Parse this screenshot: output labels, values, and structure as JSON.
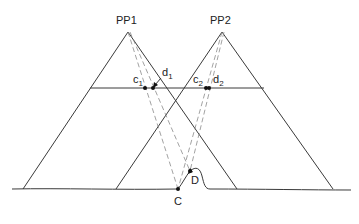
{
  "figure": {
    "type": "stereo-photogrammetry-parallax-diagram",
    "colors": {
      "line": "#3a3a3a",
      "ray": "#8a8a8a",
      "point": "#111111",
      "background": "#ffffff"
    },
    "labels": {
      "pp1": "PP1",
      "pp2": "PP2",
      "c1": "c",
      "c1_sub": "1",
      "d1": "d",
      "d1_sub": "1",
      "c2": "c",
      "c2_sub": "2",
      "d2": "d",
      "d2_sub": "2",
      "C": "C",
      "D": "D"
    },
    "points": {
      "PP1": [
        128,
        32
      ],
      "PP2": [
        222,
        32
      ],
      "c1": [
        145,
        88
      ],
      "d1": [
        153,
        88
      ],
      "c2": [
        206,
        88
      ],
      "d2": [
        209,
        88
      ],
      "C": [
        178,
        189
      ],
      "D": [
        190,
        171
      ]
    },
    "film_plane_y": 88,
    "ground_y": 189
  }
}
